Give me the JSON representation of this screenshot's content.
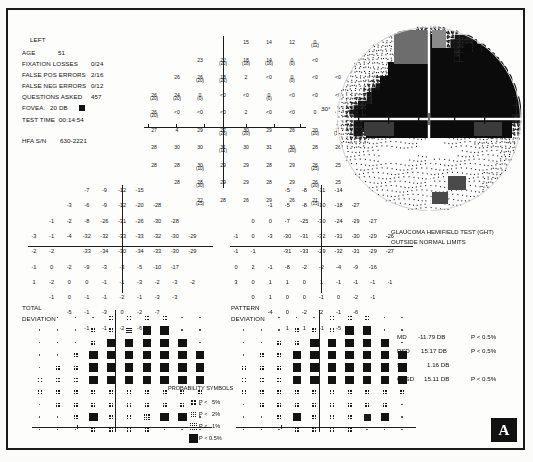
{
  "report": {
    "eye": "LEFT",
    "age_label": "AGE",
    "age_value": "51",
    "fixation_losses_label": "FIXATION LOSSES",
    "fixation_losses_value": "0/24",
    "false_pos_label": "FALSE POS ERRORS",
    "false_pos_value": "2/16",
    "false_neg_label": "FALSE NEG ERRORS",
    "false_neg_value": "0/12",
    "questions_label": "QUESTIONS ASKED",
    "questions_value": "457",
    "fovea_label": "FOVEA:",
    "fovea_value": "20 DB",
    "test_time_label": "TEST TIME",
    "test_time_value": "00:14:54",
    "serial_label": "HFA S/N",
    "serial_value": "630-2221"
  },
  "ght": {
    "line1": "GLAUCOMA HEMIFIELD TEST (GHT)",
    "line2": "OUTSIDE NORMAL LIMITS"
  },
  "indices": [
    {
      "name": "MD",
      "value": "-11.79 DB",
      "p": "P < 0.5%"
    },
    {
      "name": "PSD",
      "value": "15.17 DB",
      "p": "P < 0.5%"
    },
    {
      "name": "SF",
      "value": "1.16 DB",
      "p": ""
    },
    {
      "name": "CPSD",
      "value": "15.11 DB",
      "p": "P < 0.5%"
    }
  ],
  "deviation_titles": {
    "total_line1": "TOTAL",
    "total_line2": "DEVIATION",
    "pattern_line1": "PATTERN",
    "pattern_line2": "DEVIATION"
  },
  "legend": {
    "title": "PROBABILITY SYMBOLS",
    "items": [
      {
        "symbol": "sparse",
        "text": "P <   5%"
      },
      {
        "symbol": "medium",
        "text": "P <   2%"
      },
      {
        "symbol": "dense",
        "text": "P <   1%"
      },
      {
        "symbol": "solid",
        "text": "P < 0.5%"
      }
    ]
  },
  "axis_label_30": "30°",
  "chart_data": {
    "type": "heatmap",
    "xlabel": "Degrees (nasal/temporal)",
    "ylabel": "Degrees (superior/inferior)",
    "threshold_grid": {
      "description": "Measured threshold sensitivity in dB. Values in parentheses are retest values. Null = not tested.",
      "rows": [
        [
          null,
          null,
          null,
          null,
          "15",
          "14",
          "12",
          "0(12)",
          null,
          null,
          null,
          null
        ],
        [
          null,
          null,
          "23",
          "22(20)",
          "18(18)",
          "14(16)",
          "0(0)",
          "<0",
          null,
          null,
          null,
          null
        ],
        [
          null,
          "26",
          "26(20)",
          "18(22)",
          "2",
          "<0",
          "0(0)",
          "<0",
          "<0",
          null,
          null,
          null
        ],
        [
          "26(20)",
          "24(20)",
          "0(0)",
          "<0",
          "<0",
          "0(0)",
          "<0",
          "<0",
          "<0",
          null,
          null,
          null
        ],
        [
          "26(20)",
          "<0",
          "<0",
          "<0",
          "2",
          "<0",
          "<0",
          "0",
          "<0",
          null,
          null,
          null
        ],
        [
          "27",
          "4",
          "29",
          "27(23)",
          "30(20)",
          "29",
          "26",
          "20(20)",
          "18(10)",
          null,
          null,
          null
        ],
        [
          "28",
          "30",
          "30",
          "31(11)",
          "30",
          "31",
          "30(20)",
          "28",
          "26",
          "24",
          null,
          null
        ],
        [
          "28",
          "28",
          "30(10)",
          "29",
          "29",
          "28",
          "29",
          "26(25)",
          "25",
          null,
          null,
          null
        ],
        [
          null,
          "28",
          "28(30)",
          "29",
          "29",
          "28",
          "29",
          "26(20)",
          "25",
          null,
          null,
          null
        ],
        [
          null,
          null,
          "22(25)",
          "28",
          "26",
          "29",
          "26",
          "21(15)",
          null,
          null,
          null,
          null
        ]
      ]
    },
    "total_deviation_numeric": {
      "description": "Total deviation values in dB",
      "rows": [
        [
          null,
          null,
          null,
          "-7",
          "-9",
          "-12",
          "-15",
          null,
          null,
          null
        ],
        [
          null,
          null,
          "-3",
          "-6",
          "-9",
          "-12",
          "-20",
          "-28",
          null,
          null
        ],
        [
          null,
          "-1",
          "-2",
          "-8",
          "-26",
          "-31",
          "-26",
          "-30",
          "-28",
          null
        ],
        [
          "-3",
          "-1",
          "-4",
          "-32",
          "-32",
          "-33",
          "-33",
          "-32",
          "-30",
          "-29"
        ],
        [
          "-2",
          "-2",
          null,
          "-33",
          "-34",
          "-30",
          "-34",
          "-33",
          "-30",
          "-29"
        ],
        [
          "-1",
          "0",
          "-2",
          "-9",
          "-3",
          "-3",
          "-5",
          "-10",
          "-17",
          null
        ],
        [
          "1",
          "-2",
          "0",
          "0",
          "-1",
          "-1",
          "-3",
          "-2",
          "-3",
          "-2"
        ],
        [
          null,
          "-1",
          "0",
          "-1",
          "-1",
          "-2",
          "-1",
          "-3",
          "-3",
          null
        ],
        [
          null,
          null,
          "-5",
          "-1",
          "-3",
          "0",
          "-2",
          "-7",
          null,
          null
        ],
        [
          null,
          null,
          null,
          "-1",
          "-1",
          "-2",
          "-6",
          null,
          null,
          null
        ]
      ]
    },
    "pattern_deviation_numeric": {
      "description": "Pattern deviation values in dB",
      "rows": [
        [
          null,
          null,
          null,
          "-5",
          "-8",
          "-11",
          "-14",
          null,
          null,
          null
        ],
        [
          null,
          null,
          "-1",
          "-5",
          "-8",
          "-10",
          "-18",
          "-27",
          null,
          null
        ],
        [
          null,
          "0",
          "0",
          "-7",
          "-25",
          "-30",
          "-24",
          "-29",
          "-27",
          null
        ],
        [
          "-1",
          "0",
          "-3",
          "-30",
          "-31",
          "-32",
          "-31",
          "-30",
          "-29",
          "-26"
        ],
        [
          "-1",
          "-1",
          null,
          "-31",
          "-33",
          "-29",
          "-32",
          "-31",
          "-29",
          "-27"
        ],
        [
          "0",
          "2",
          "-1",
          "-8",
          "-2",
          "-2",
          "-4",
          "-9",
          "-16",
          null
        ],
        [
          "3",
          "0",
          "1",
          "1",
          "0",
          "1",
          "-1",
          "-1",
          "-1",
          "-1"
        ],
        [
          null,
          "0",
          "1",
          "0",
          "0",
          "-1",
          "0",
          "-2",
          "-1",
          null
        ],
        [
          null,
          null,
          "-4",
          "0",
          "-2",
          "2",
          "-1",
          "-6",
          null,
          null
        ],
        [
          null,
          null,
          null,
          "1",
          "1",
          "-1",
          "-5",
          null,
          null,
          null
        ]
      ]
    },
    "total_deviation_probability": {
      "description": "Symbol grid. 0=blank, 1=P<5%, 2=P<2%, 3=P<1%, 4=P<0.5%",
      "rows": [
        [
          0,
          0,
          0,
          0,
          1,
          1,
          1,
          1,
          0,
          0
        ],
        [
          0,
          0,
          0,
          1,
          1,
          2,
          4,
          4,
          0,
          0
        ],
        [
          0,
          0,
          0,
          1,
          4,
          4,
          4,
          4,
          4,
          0
        ],
        [
          0,
          0,
          1,
          4,
          4,
          4,
          4,
          4,
          4,
          4
        ],
        [
          0,
          1,
          1,
          4,
          4,
          4,
          4,
          4,
          4,
          4
        ],
        [
          1,
          1,
          1,
          4,
          4,
          4,
          4,
          4,
          4,
          4
        ],
        [
          1,
          1,
          1,
          1,
          1,
          1,
          1,
          1,
          1,
          1
        ],
        [
          0,
          1,
          1,
          1,
          1,
          1,
          1,
          1,
          1,
          0
        ],
        [
          0,
          0,
          1,
          4,
          1,
          1,
          2,
          4,
          4,
          0
        ],
        [
          0,
          0,
          0,
          1,
          1,
          1,
          1,
          0,
          0,
          0
        ]
      ]
    },
    "pattern_deviation_probability": {
      "description": "Symbol grid. 0=blank, 1=P<5%, 2=P<2%, 3=P<1%, 4=P<0.5%",
      "rows": [
        [
          0,
          0,
          0,
          0,
          0,
          1,
          1,
          1,
          0,
          0
        ],
        [
          0,
          0,
          0,
          1,
          1,
          1,
          4,
          4,
          0,
          0
        ],
        [
          0,
          0,
          1,
          1,
          4,
          4,
          4,
          4,
          4,
          0
        ],
        [
          0,
          1,
          1,
          4,
          4,
          4,
          4,
          4,
          4,
          4
        ],
        [
          1,
          1,
          1,
          4,
          4,
          4,
          4,
          4,
          4,
          4
        ],
        [
          1,
          1,
          1,
          4,
          4,
          4,
          4,
          4,
          4,
          4
        ],
        [
          1,
          1,
          1,
          1,
          1,
          1,
          1,
          1,
          1,
          1
        ],
        [
          0,
          1,
          1,
          1,
          1,
          1,
          1,
          1,
          1,
          0
        ],
        [
          0,
          0,
          1,
          4,
          1,
          1,
          1,
          3,
          4,
          0
        ],
        [
          0,
          0,
          0,
          1,
          1,
          1,
          1,
          0,
          0,
          0
        ]
      ]
    }
  },
  "badge": {
    "label": "A"
  }
}
